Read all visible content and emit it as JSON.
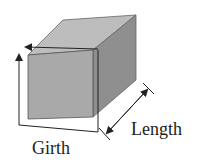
{
  "diagram": {
    "type": "rectangular-box-dimension-illustration",
    "labels": {
      "girth": "Girth",
      "length": "Length"
    },
    "colors": {
      "front_face": "#a9a9a9",
      "top_face": "#bdbdbd",
      "side_face": "#8f8f8f",
      "edge": "#555555",
      "measure_line": "#222222",
      "text": "#222222"
    }
  }
}
